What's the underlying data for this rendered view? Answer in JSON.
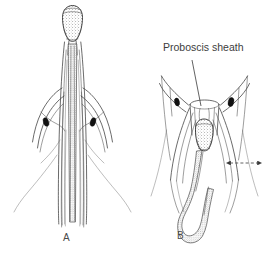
{
  "figure": {
    "background_color": "#ffffff",
    "ink_color": "#3a3a3a",
    "accent_dark": "#111111",
    "width": 279,
    "height": 263,
    "panels": [
      {
        "id": "panel-a",
        "label": "A",
        "label_x": 63,
        "label_y": 232,
        "description": "Mosquito proboscis with fascicle held within the labial sheath, labrum bulb at tip"
      },
      {
        "id": "panel-b",
        "label": "B",
        "label_x": 177,
        "label_y": 230,
        "description": "Mosquito proboscis with labial sheath buckled back and fascicle looped outward"
      }
    ],
    "callouts": [
      {
        "id": "proboscis-sheath-callout",
        "text": "Proboscis sheath",
        "text_x": 163,
        "text_y": 47,
        "leader_from_x": 192,
        "leader_from_y": 60,
        "leader_to_x": 200,
        "leader_to_y": 104
      }
    ],
    "annotations": [
      {
        "id": "sheath-fold-arrow",
        "type": "dashed-arrow",
        "x1": 228,
        "y1": 163,
        "x2": 260,
        "y2": 163
      }
    ],
    "markers": [
      {
        "id": "palp-spot-a-left",
        "cx": 46,
        "cy": 122,
        "rx": 2.6,
        "ry": 4.4,
        "rot": -18
      },
      {
        "id": "palp-spot-a-right",
        "cx": 93,
        "cy": 122,
        "rx": 2.6,
        "ry": 4.4,
        "rot": 18
      },
      {
        "id": "palp-spot-b-left",
        "cx": 177,
        "cy": 102,
        "rx": 2.4,
        "ry": 4.0,
        "rot": -12
      },
      {
        "id": "palp-spot-b-right",
        "cx": 231,
        "cy": 102,
        "rx": 2.8,
        "ry": 4.6,
        "rot": 12
      }
    ]
  }
}
